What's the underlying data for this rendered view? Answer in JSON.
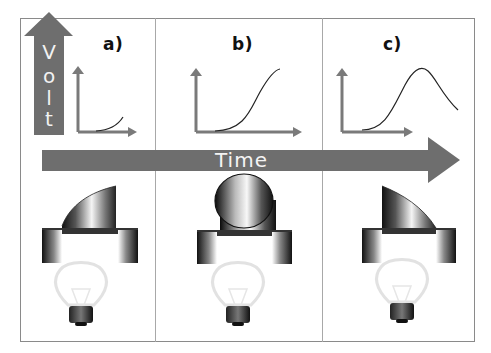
{
  "diagram": {
    "y_axis_arrow": {
      "label_letters": [
        "V",
        "o",
        "l",
        "t"
      ],
      "label": "Volt"
    },
    "x_axis_arrow": {
      "label": "Time"
    },
    "panels": [
      {
        "id": "a",
        "label": "a)",
        "curve": "initial rise (start of exponential curve)",
        "magnet_state": "tilted left, partially entering coil",
        "bulb_state": "off"
      },
      {
        "id": "b",
        "label": "b)",
        "curve": "S-shaped rise to plateau",
        "magnet_state": "upright, face-on above coil",
        "bulb_state": "off"
      },
      {
        "id": "c",
        "label": "c)",
        "curve": "rise to peak then fall",
        "magnet_state": "tilted right, leaving coil",
        "bulb_state": "off"
      }
    ],
    "colors": {
      "arrow_fill": "#6e6e6e",
      "arrow_text": "#f2f2f2",
      "frame": "#8a8a8a",
      "curve": "#222222",
      "axis": "#7a7a7a"
    }
  }
}
